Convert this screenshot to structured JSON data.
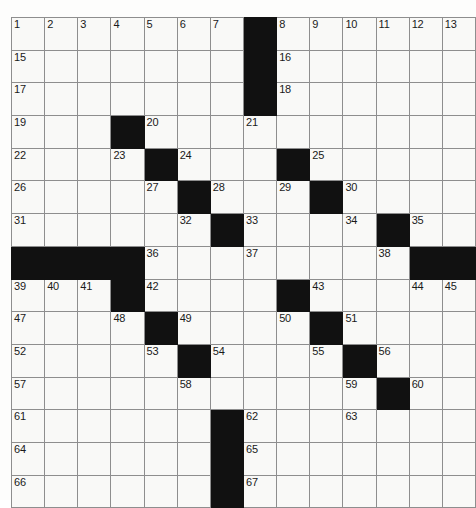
{
  "puzzle": {
    "title": "Crossword Grid",
    "type": "crossword-grid",
    "columns": 14,
    "rows": 15,
    "cell_size_px": 32.6,
    "colors": {
      "block": "#111111",
      "cell": "#f9f9f7",
      "grid_line": "#8e8e8e",
      "number_text": "#1a1a1a",
      "page_background": "#ffffff"
    },
    "max_clue_number": 67,
    "grid": [
      [
        {
          "n": "1"
        },
        {
          "n": "2"
        },
        {
          "n": "3"
        },
        {
          "n": "4"
        },
        {
          "n": "5"
        },
        {
          "n": "6"
        },
        {
          "n": "7"
        },
        {
          "block": true
        },
        {
          "n": "8"
        },
        {
          "n": "9"
        },
        {
          "n": "10"
        },
        {
          "n": "11"
        },
        {
          "n": "12"
        },
        {
          "n": "13"
        }
      ],
      [
        {
          "n": "15"
        },
        {},
        {},
        {},
        {},
        {},
        {},
        {
          "block": true
        },
        {
          "n": "16"
        },
        {},
        {},
        {},
        {},
        {}
      ],
      [
        {
          "n": "17"
        },
        {},
        {},
        {},
        {},
        {},
        {},
        {
          "block": true
        },
        {
          "n": "18"
        },
        {},
        {},
        {},
        {},
        {}
      ],
      [
        {
          "n": "19"
        },
        {},
        {},
        {
          "block": true
        },
        {
          "n": "20"
        },
        {},
        {},
        {
          "n": "21"
        },
        {},
        {},
        {},
        {},
        {},
        {}
      ],
      [
        {
          "n": "22"
        },
        {},
        {},
        {
          "n": "23"
        },
        {
          "block": true
        },
        {
          "n": "24"
        },
        {},
        {},
        {
          "block": true
        },
        {
          "n": "25"
        },
        {},
        {},
        {},
        {}
      ],
      [
        {
          "n": "26"
        },
        {},
        {},
        {},
        {
          "n": "27"
        },
        {
          "block": true
        },
        {
          "n": "28"
        },
        {},
        {
          "n": "29"
        },
        {
          "block": true
        },
        {
          "n": "30"
        },
        {},
        {},
        {}
      ],
      [
        {
          "n": "31"
        },
        {},
        {},
        {},
        {},
        {
          "n": "32"
        },
        {
          "block": true
        },
        {
          "n": "33"
        },
        {},
        {},
        {
          "n": "34"
        },
        {
          "block": true
        },
        {
          "n": "35"
        },
        {}
      ],
      [
        {
          "block": true
        },
        {
          "block": true
        },
        {
          "block": true
        },
        {
          "block": true
        },
        {
          "n": "36"
        },
        {},
        {},
        {
          "n": "37"
        },
        {},
        {},
        {},
        {
          "n": "38"
        },
        {
          "block": true
        },
        {
          "block": true
        }
      ],
      [
        {
          "n": "39"
        },
        {
          "n": "40"
        },
        {
          "n": "41"
        },
        {
          "block": true
        },
        {
          "n": "42"
        },
        {},
        {},
        {},
        {
          "block": true
        },
        {
          "n": "43"
        },
        {},
        {},
        {
          "n": "44"
        },
        {
          "n": "45"
        }
      ],
      [
        {
          "n": "47"
        },
        {},
        {},
        {
          "n": "48"
        },
        {
          "block": true
        },
        {
          "n": "49"
        },
        {},
        {},
        {
          "n": "50"
        },
        {
          "block": true
        },
        {
          "n": "51"
        },
        {},
        {},
        {}
      ],
      [
        {
          "n": "52"
        },
        {},
        {},
        {},
        {
          "n": "53"
        },
        {
          "block": true
        },
        {
          "n": "54"
        },
        {},
        {},
        {
          "n": "55"
        },
        {
          "block": true
        },
        {
          "n": "56"
        },
        {},
        {}
      ],
      [
        {
          "n": "57"
        },
        {},
        {},
        {},
        {},
        {
          "n": "58"
        },
        {},
        {},
        {},
        {},
        {
          "n": "59"
        },
        {
          "block": true
        },
        {
          "n": "60"
        },
        {}
      ],
      [
        {
          "n": "61"
        },
        {},
        {},
        {},
        {},
        {},
        {
          "block": true
        },
        {
          "n": "62"
        },
        {},
        {},
        {
          "n": "63"
        },
        {},
        {},
        {}
      ],
      [
        {
          "n": "64"
        },
        {},
        {},
        {},
        {},
        {},
        {
          "block": true
        },
        {
          "n": "65"
        },
        {},
        {},
        {},
        {},
        {},
        {}
      ],
      [
        {
          "n": "66"
        },
        {},
        {},
        {},
        {},
        {},
        {
          "block": true
        },
        {
          "n": "67"
        },
        {},
        {},
        {},
        {},
        {},
        {}
      ]
    ],
    "extra_numbers": {
      "row1_col14": "14",
      "row9_col14": "46"
    }
  }
}
